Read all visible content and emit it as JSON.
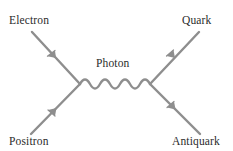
{
  "diagram": {
    "type": "feynman-diagram",
    "width": 233,
    "height": 151,
    "background_color": "#ffffff",
    "line_color": "#8e8e8e",
    "text_color": "#2b2b2b",
    "labels": {
      "electron": "Electron",
      "quark": "Quark",
      "photon": "Photon",
      "positron": "Positron",
      "antiquark": "Antiquark"
    },
    "vertices": {
      "left": {
        "x": 80,
        "y": 84
      },
      "right": {
        "x": 150,
        "y": 84
      }
    },
    "lines": [
      {
        "name": "electron-line",
        "from": {
          "x": 32,
          "y": 32
        },
        "to": {
          "x": 80,
          "y": 84
        },
        "arrow_direction": "toward-vertex",
        "particle": "Electron"
      },
      {
        "name": "positron-line",
        "from": {
          "x": 31,
          "y": 134
        },
        "to": {
          "x": 80,
          "y": 84
        },
        "arrow_direction": "toward-vertex",
        "particle": "Positron"
      },
      {
        "name": "quark-line",
        "from": {
          "x": 150,
          "y": 84
        },
        "to": {
          "x": 199,
          "y": 32
        },
        "arrow_direction": "away-from-vertex",
        "particle": "Quark"
      },
      {
        "name": "antiquark-line",
        "from": {
          "x": 150,
          "y": 84
        },
        "to": {
          "x": 200,
          "y": 134
        },
        "arrow_direction": "away-from-vertex",
        "particle": "Antiquark"
      }
    ],
    "photon_propagator": {
      "name": "photon-wave",
      "from": {
        "x": 80,
        "y": 84
      },
      "to": {
        "x": 150,
        "y": 84
      },
      "style": "wavy",
      "periods": 3.5,
      "amplitude": 6
    }
  }
}
